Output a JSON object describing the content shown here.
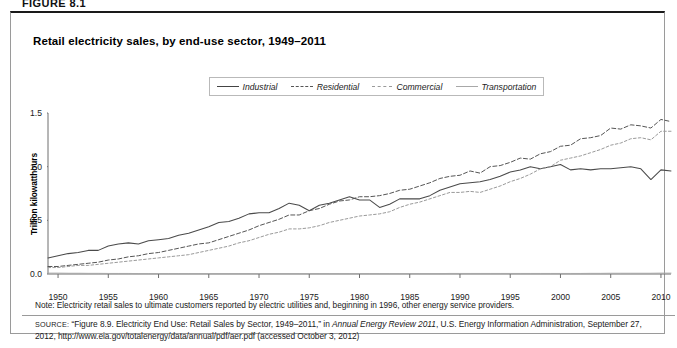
{
  "figure_label": "FIGURE 8.1",
  "panel": {
    "title": "Retail electricity sales, by end-use sector, 1949–2011",
    "note": "Note: Electricity retail sales to ultimate customers reported by electric utilities and, beginning in 1996, other energy service providers.",
    "source": {
      "prefix": "SOURCE:",
      "part1": "“Figure 8.9. Electricity End Use: Retail Sales by Sector, 1949–2011,” in ",
      "italic1": "Annual Energy Review 2011",
      "part2": ", U.S. Energy Information Administration, September 27, 2012, http://www.eia.gov/totalenergy/data/annual/pdf/aer.pdf (accessed October 3, 2012)"
    }
  },
  "chart_data": {
    "type": "line",
    "title": "Retail electricity sales, by end-use sector, 1949–2011",
    "xlabel": "",
    "ylabel": "Trillion kilowatthours",
    "xlim": [
      1949,
      2011
    ],
    "ylim": [
      0.0,
      1.5
    ],
    "grid": false,
    "legend_position": "top-center",
    "yticks": [
      "0.0",
      "0.5",
      "1.0",
      "1.5"
    ],
    "ytick_values": [
      0.0,
      0.5,
      1.0,
      1.5
    ],
    "xticks": [
      "1950",
      "1955",
      "1960",
      "1965",
      "1970",
      "1975",
      "1980",
      "1985",
      "1990",
      "1995",
      "2000",
      "2005",
      "2010"
    ],
    "xtick_values": [
      1950,
      1955,
      1960,
      1965,
      1970,
      1975,
      1980,
      1985,
      1990,
      1995,
      2000,
      2005,
      2010
    ],
    "x": [
      1949,
      1950,
      1951,
      1952,
      1953,
      1954,
      1955,
      1956,
      1957,
      1958,
      1959,
      1960,
      1961,
      1962,
      1963,
      1964,
      1965,
      1966,
      1967,
      1968,
      1969,
      1970,
      1971,
      1972,
      1973,
      1974,
      1975,
      1976,
      1977,
      1978,
      1979,
      1980,
      1981,
      1982,
      1983,
      1984,
      1985,
      1986,
      1987,
      1988,
      1989,
      1990,
      1991,
      1992,
      1993,
      1994,
      1995,
      1996,
      1997,
      1998,
      1999,
      2000,
      2001,
      2002,
      2003,
      2004,
      2005,
      2006,
      2007,
      2008,
      2009,
      2010,
      2011
    ],
    "series": [
      {
        "name": "Industrial",
        "style": "solid",
        "color": "#4a4a4a",
        "values": [
          0.15,
          0.17,
          0.19,
          0.2,
          0.22,
          0.22,
          0.26,
          0.28,
          0.29,
          0.28,
          0.31,
          0.32,
          0.33,
          0.36,
          0.38,
          0.41,
          0.44,
          0.48,
          0.49,
          0.52,
          0.56,
          0.57,
          0.57,
          0.61,
          0.66,
          0.64,
          0.59,
          0.64,
          0.66,
          0.69,
          0.72,
          0.69,
          0.69,
          0.62,
          0.65,
          0.7,
          0.7,
          0.7,
          0.73,
          0.78,
          0.81,
          0.84,
          0.85,
          0.86,
          0.88,
          0.91,
          0.95,
          0.97,
          1.0,
          0.98,
          1.0,
          1.02,
          0.97,
          0.98,
          0.97,
          0.98,
          0.98,
          0.99,
          1.0,
          0.98,
          0.88,
          0.97,
          0.96
        ]
      },
      {
        "name": "Residential",
        "style": "dashed",
        "color": "#555555",
        "values": [
          0.07,
          0.07,
          0.08,
          0.09,
          0.1,
          0.11,
          0.13,
          0.14,
          0.16,
          0.17,
          0.19,
          0.2,
          0.22,
          0.24,
          0.26,
          0.28,
          0.29,
          0.32,
          0.35,
          0.38,
          0.41,
          0.45,
          0.48,
          0.51,
          0.55,
          0.55,
          0.59,
          0.61,
          0.65,
          0.68,
          0.69,
          0.72,
          0.72,
          0.73,
          0.75,
          0.78,
          0.79,
          0.82,
          0.85,
          0.89,
          0.91,
          0.92,
          0.96,
          0.94,
          1.0,
          1.01,
          1.04,
          1.08,
          1.07,
          1.12,
          1.14,
          1.19,
          1.2,
          1.26,
          1.27,
          1.29,
          1.36,
          1.35,
          1.39,
          1.38,
          1.36,
          1.44,
          1.42
        ]
      },
      {
        "name": "Commercial",
        "style": "dotted",
        "color": "#9a9a9a",
        "values": [
          0.06,
          0.06,
          0.07,
          0.08,
          0.08,
          0.09,
          0.1,
          0.11,
          0.12,
          0.13,
          0.14,
          0.15,
          0.16,
          0.17,
          0.18,
          0.2,
          0.22,
          0.24,
          0.26,
          0.29,
          0.31,
          0.34,
          0.37,
          0.39,
          0.42,
          0.42,
          0.43,
          0.45,
          0.48,
          0.5,
          0.52,
          0.54,
          0.55,
          0.56,
          0.58,
          0.62,
          0.65,
          0.67,
          0.7,
          0.73,
          0.76,
          0.76,
          0.77,
          0.76,
          0.79,
          0.82,
          0.86,
          0.89,
          0.93,
          0.98,
          1.0,
          1.06,
          1.08,
          1.1,
          1.13,
          1.16,
          1.2,
          1.22,
          1.26,
          1.27,
          1.25,
          1.33,
          1.33
        ]
      },
      {
        "name": "Transportation",
        "style": "solid-light",
        "color": "#a8a8a8",
        "values": [
          0.008,
          0.008,
          0.007,
          0.007,
          0.006,
          0.006,
          0.005,
          0.005,
          0.005,
          0.004,
          0.004,
          0.004,
          0.004,
          0.004,
          0.004,
          0.004,
          0.004,
          0.004,
          0.004,
          0.004,
          0.004,
          0.004,
          0.004,
          0.004,
          0.004,
          0.004,
          0.004,
          0.004,
          0.004,
          0.004,
          0.004,
          0.004,
          0.004,
          0.004,
          0.004,
          0.004,
          0.004,
          0.004,
          0.004,
          0.004,
          0.005,
          0.005,
          0.005,
          0.005,
          0.005,
          0.005,
          0.005,
          0.005,
          0.005,
          0.005,
          0.005,
          0.005,
          0.005,
          0.005,
          0.006,
          0.006,
          0.007,
          0.007,
          0.007,
          0.007,
          0.007,
          0.008,
          0.008
        ]
      }
    ]
  }
}
